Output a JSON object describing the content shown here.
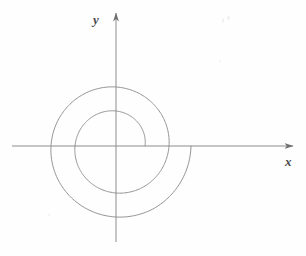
{
  "figure": {
    "width": 306,
    "height": 256,
    "background_color": "#fefefe",
    "line_color": "#8d8d8d",
    "curve_color": "#939393",
    "label_color": "#4a4a4a"
  },
  "axes": {
    "x_label": "x",
    "y_label": "y",
    "origin_px": {
      "x": 116,
      "y": 146
    },
    "x_axis_px": {
      "x_start": 12,
      "x_end": 296,
      "y": 146
    },
    "y_axis_px": {
      "y_start": 10,
      "y_end": 242,
      "x": 116
    },
    "arrowheads": [
      "x-positive",
      "y-positive"
    ],
    "ticks": [],
    "tick_labels": [],
    "grid": false
  },
  "chart_data": {
    "type": "line",
    "title": "",
    "subtitle": "",
    "xlabel": "x",
    "ylabel": "y",
    "grid": false,
    "legend": [],
    "annotations": [],
    "coordinate_system": "polar-on-cartesian",
    "curve_name": "archimedean-spiral",
    "polar_equation": "r = 29 + 7.3*theta",
    "theta_range_rad": [
      0,
      6.283185
    ],
    "theta_range_turns": 2,
    "direction": "counterclockwise",
    "r_start": 29,
    "r_end": 75,
    "axis_crossings_positive_x_px": [
      145,
      166,
      191
    ],
    "extent_px": {
      "left": 62,
      "right": 191,
      "top": 86,
      "bottom": 196
    },
    "series": [
      {
        "name": "spiral",
        "theta_deg": [
          0,
          30,
          60,
          90,
          120,
          150,
          180,
          210,
          240,
          270,
          300,
          330,
          360,
          390,
          420,
          450,
          480,
          510,
          540,
          570,
          600,
          630,
          660,
          690,
          720
        ],
        "r": [
          29.0,
          32.8,
          36.6,
          40.5,
          44.3,
          48.1,
          51.9,
          55.8,
          59.6,
          63.4,
          67.2,
          71.1,
          74.9,
          78.7,
          82.5,
          86.4,
          90.2,
          94.0,
          97.8,
          101.7,
          105.5,
          109.3,
          113.1,
          117.0,
          120.8
        ],
        "r_scaled_px": [
          29.0,
          31.0,
          33.0,
          35.0,
          37.0,
          39.0,
          41.0,
          43.0,
          45.0,
          47.0,
          49.0,
          51.0,
          53.0,
          55.0,
          57.0,
          59.0,
          61.0,
          63.0,
          65.0,
          67.0,
          69.0,
          71.0,
          73.0,
          74.0,
          75.0
        ]
      }
    ],
    "xlim": [
      -104,
      180
    ],
    "ylim": [
      -96,
      136
    ]
  }
}
